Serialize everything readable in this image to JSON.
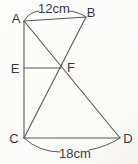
{
  "figure": {
    "canvas": {
      "width": 138,
      "height": 164,
      "background": "#fbfbf8"
    },
    "style": {
      "stroke_color": "#585858",
      "label_color": "#3a3a3a"
    },
    "points": [
      {
        "id": "A",
        "label": "A",
        "x": 24,
        "y": 21,
        "lx": 16,
        "ly": 23
      },
      {
        "id": "B",
        "label": "B",
        "x": 86,
        "y": 17,
        "lx": 91,
        "ly": 17
      },
      {
        "id": "C",
        "label": "C",
        "x": 24,
        "y": 138,
        "lx": 14,
        "ly": 143
      },
      {
        "id": "D",
        "label": "D",
        "x": 120,
        "y": 138,
        "lx": 128,
        "ly": 143
      },
      {
        "id": "E",
        "label": "E",
        "x": 24,
        "y": 68,
        "lx": 15,
        "ly": 73
      },
      {
        "id": "F",
        "label": "F",
        "x": 61,
        "y": 68,
        "lx": 71,
        "ly": 72
      }
    ],
    "segments": [
      {
        "from": "A",
        "to": "B"
      },
      {
        "from": "A",
        "to": "C"
      },
      {
        "from": "A",
        "to": "D"
      },
      {
        "from": "B",
        "to": "C"
      },
      {
        "from": "C",
        "to": "D"
      },
      {
        "from": "E",
        "to": "F"
      }
    ],
    "measurements": [
      {
        "label": "12cm",
        "tx": 54,
        "ty": 13,
        "arcs": [
          "M24,21 Q29,12 39,11",
          "M69,11 Q79,12 86,17"
        ]
      },
      {
        "label": "18cm",
        "tx": 75,
        "ty": 158,
        "arcs": [
          "M24,138 Q39,152 60,152",
          "M89,150 Q106,147 120,138"
        ]
      }
    ]
  }
}
